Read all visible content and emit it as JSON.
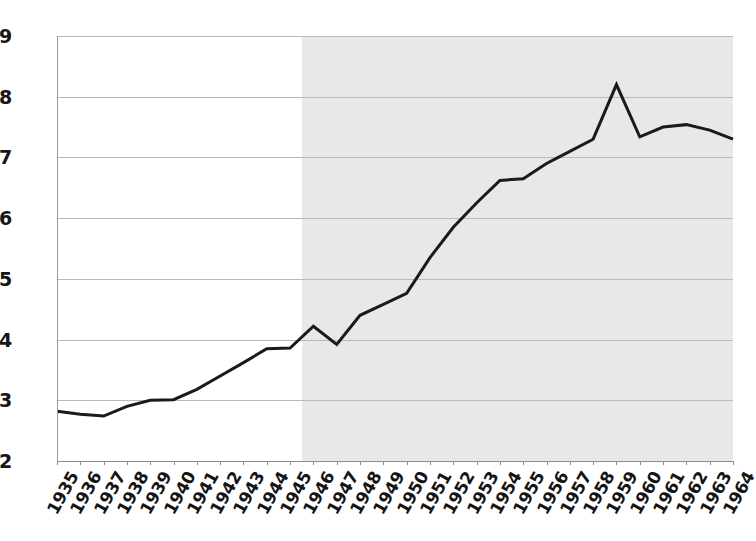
{
  "chart_data": {
    "type": "line",
    "title": "",
    "subtitle": "",
    "xlabel": "",
    "ylabel": "",
    "ylim": [
      12,
      19
    ],
    "yticks": [
      12,
      13,
      14,
      15,
      16,
      17,
      18,
      19
    ],
    "ytick_labels": [
      "12",
      "13",
      "14",
      "15",
      "16",
      "17",
      "18",
      "19"
    ],
    "grid": true,
    "legend": null,
    "legend_position": "none",
    "line_color": "#1a1a1a",
    "line_width": 3,
    "shaded_region": {
      "from": "1946",
      "to": "1964",
      "color": "#e8e8e8",
      "label": ""
    },
    "x": [
      "1935",
      "1936",
      "1937",
      "1938",
      "1939",
      "1940",
      "1941",
      "1942",
      "1943",
      "1944",
      "1945",
      "1946",
      "1947",
      "1948",
      "1949",
      "1950",
      "1951",
      "1952",
      "1953",
      "1954",
      "1955",
      "1956",
      "1957",
      "1958",
      "1959",
      "1960",
      "1961",
      "1962",
      "1963",
      "1964"
    ],
    "categories": [
      "1935",
      "1936",
      "1937",
      "1938",
      "1939",
      "1940",
      "1941",
      "1942",
      "1943",
      "1944",
      "1945",
      "1946",
      "1947",
      "1948",
      "1949",
      "1950",
      "1951",
      "1952",
      "1953",
      "1954",
      "1955",
      "1956",
      "1957",
      "1958",
      "1959",
      "1960",
      "1961",
      "1962",
      "1963",
      "1964"
    ],
    "values": [
      12.82,
      12.77,
      12.74,
      12.9,
      13.0,
      13.01,
      13.18,
      13.4,
      13.62,
      13.85,
      13.86,
      14.22,
      13.92,
      14.4,
      14.58,
      14.76,
      15.35,
      15.85,
      16.25,
      16.62,
      16.65,
      16.9,
      17.1,
      17.3,
      18.2,
      17.34,
      17.5,
      17.54,
      17.45,
      17.3
    ],
    "series": [
      {
        "name": "series-1",
        "values": [
          12.82,
          12.77,
          12.74,
          12.9,
          13.0,
          13.01,
          13.18,
          13.4,
          13.62,
          13.85,
          13.86,
          14.22,
          13.92,
          14.4,
          14.58,
          14.76,
          15.35,
          15.85,
          16.25,
          16.62,
          16.65,
          16.9,
          17.1,
          17.3,
          18.2,
          17.34,
          17.5,
          17.54,
          17.45,
          17.3
        ]
      }
    ]
  }
}
